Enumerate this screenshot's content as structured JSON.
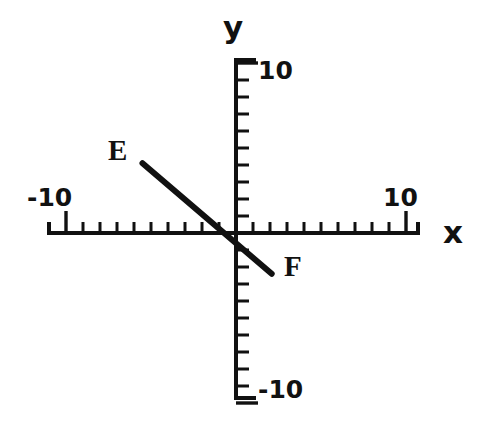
{
  "figure": {
    "type": "coordinate-plane-line-segment",
    "background_color": "#ffffff",
    "ink_color": "#111111",
    "width": 485,
    "height": 429
  },
  "axes": {
    "x": {
      "title": "x",
      "min_label": "-10",
      "max_label": "10",
      "range": [
        -10,
        10
      ],
      "tick_interval": 1,
      "major_ticks": [
        -10,
        10
      ],
      "pixel_origin": 236,
      "pixel_per_unit": 17,
      "pixel_y": 233,
      "pixel_start": 47,
      "pixel_end": 420
    },
    "y": {
      "title": "y",
      "min_label": "-10",
      "max_label": "10",
      "range": [
        -10,
        10
      ],
      "tick_interval": 1,
      "major_ticks": [
        -10,
        10
      ],
      "pixel_origin": 233,
      "pixel_per_unit": 17,
      "pixel_x": 236,
      "pixel_start": 58,
      "pixel_end": 400
    }
  },
  "chart_data": {
    "type": "line",
    "title": "",
    "xlabel": "x",
    "ylabel": "y",
    "xlim": [
      -10,
      10
    ],
    "ylim": [
      -10,
      10
    ],
    "grid": false,
    "legend": "none",
    "tick_interval": 1,
    "labeled_ticks": {
      "x": [
        "-10",
        "10"
      ],
      "y": [
        "-10",
        "10"
      ]
    },
    "series": [
      {
        "name": "EF",
        "kind": "segment",
        "x": [
          -5.5,
          2.1
        ],
        "y": [
          4.1,
          -2.4
        ],
        "endpoint_labels": [
          "E",
          "F"
        ],
        "color": "#111111",
        "linewidth": 6
      }
    ],
    "annotations": [
      {
        "text": "E",
        "x": -7.4,
        "y": 5.2
      },
      {
        "text": "F",
        "x": 2.9,
        "y": -1.3
      }
    ]
  },
  "points": {
    "e": {
      "label": "E",
      "data_x": -5.5,
      "data_y": 4.1,
      "pixel_x": 143,
      "pixel_y": 163
    },
    "f": {
      "label": "F",
      "data_x": 2.1,
      "data_y": -2.4,
      "pixel_x": 272,
      "pixel_y": 273
    }
  },
  "labels": {
    "y_axis_title": "y",
    "x_axis_title": "x",
    "y_max": "10",
    "y_min": "-10",
    "x_min": "-10",
    "x_max": "10",
    "point_e": "E",
    "point_f": "F"
  }
}
